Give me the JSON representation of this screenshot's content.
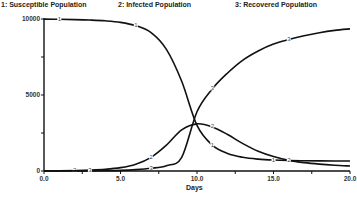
{
  "chart_data": {
    "type": "line",
    "title": "",
    "xlabel": "Days",
    "ylabel": "",
    "xlim": [
      0,
      20
    ],
    "ylim": [
      0,
      10000
    ],
    "x_ticks": [
      "0.0",
      "5.0",
      "10.0",
      "15.0",
      "20.0"
    ],
    "y_ticks": [
      "0",
      "5000",
      "10000"
    ],
    "grid": false,
    "legend_position": "top",
    "x": [
      0,
      1,
      2,
      3,
      4,
      5,
      6,
      7,
      8,
      9,
      10,
      11,
      12,
      13,
      14,
      15,
      16,
      17,
      18,
      19,
      20
    ],
    "series": [
      {
        "name": "1: Susceptible Population",
        "marker": "1",
        "values": [
          9990,
          9980,
          9960,
          9930,
          9880,
          9780,
          9560,
          9100,
          8000,
          5900,
          3000,
          1700,
          1150,
          900,
          780,
          720,
          690,
          675,
          665,
          660,
          660
        ]
      },
      {
        "name": "2: Infected Population",
        "marker": "2",
        "values": [
          10,
          20,
          35,
          60,
          110,
          220,
          450,
          900,
          1700,
          2700,
          3100,
          2900,
          2400,
          1800,
          1300,
          950,
          700,
          550,
          450,
          380,
          330
        ]
      },
      {
        "name": "3: Recovered Population",
        "marker": "3",
        "values": [
          0,
          0,
          5,
          10,
          20,
          40,
          90,
          180,
          350,
          900,
          3900,
          5400,
          6450,
          7300,
          7900,
          8350,
          8650,
          8900,
          9100,
          9250,
          9350
        ]
      }
    ]
  },
  "legend": {
    "s1": "1: Susceptible Population",
    "s2": "2: Infected Population",
    "s3": "3: Recovered Population"
  },
  "axes": {
    "xlabel": "Days",
    "x_ticks": [
      "0.0",
      "5.0",
      "10.0",
      "15.0",
      "20.0"
    ],
    "y_ticks": [
      "0",
      "5000",
      "10000"
    ]
  },
  "markers": {
    "s1": "1",
    "s2": "2",
    "s3": "3"
  }
}
